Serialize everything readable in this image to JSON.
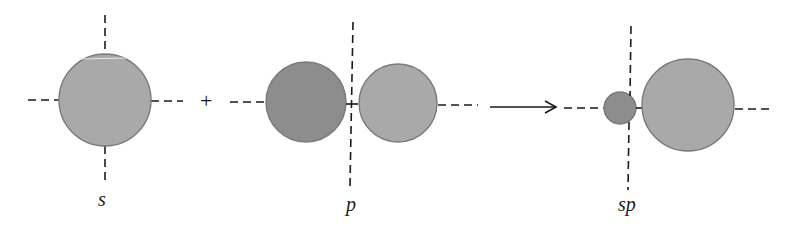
{
  "diagram": {
    "colors": {
      "light_lobe": "#a9a9a9",
      "dark_lobe": "#8d8d8d",
      "outline": "#7a7a7a",
      "line": "#1a1a1a",
      "background": "#ffffff"
    },
    "operators": {
      "plus": "+",
      "arrow": "→"
    },
    "orbitals": [
      {
        "id": "s",
        "label": "s",
        "lobes": [
          {
            "cx": 105,
            "cy": 100,
            "r": 46,
            "shade": "light"
          }
        ]
      },
      {
        "id": "p",
        "label": "p",
        "lobes": [
          {
            "cx": 306,
            "cy": 102,
            "r": 40,
            "shade": "dark"
          },
          {
            "cx": 398,
            "cy": 103,
            "r": 39,
            "shade": "light"
          }
        ]
      },
      {
        "id": "sp",
        "label": "sp",
        "lobes": [
          {
            "cx": 620,
            "cy": 108,
            "r": 16,
            "shade": "dark"
          },
          {
            "cx": 688,
            "cy": 105,
            "r": 46,
            "shade": "light"
          }
        ]
      }
    ]
  }
}
